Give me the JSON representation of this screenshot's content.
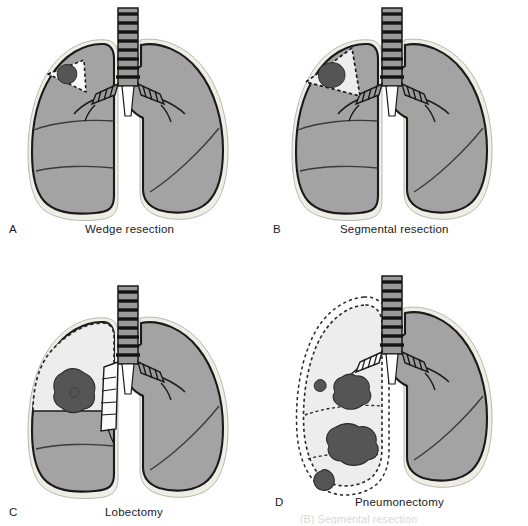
{
  "figure": {
    "background_color": "#ffffff",
    "panels": [
      {
        "letter": "A",
        "caption": "Wedge resection",
        "resection_region": "small triangular wedge in right upper lobe",
        "tumor_count": 1
      },
      {
        "letter": "B",
        "caption": "Segmental resection",
        "resection_region": "larger triangular segment in right upper lobe",
        "tumor_count": 1
      },
      {
        "letter": "C",
        "caption": "Lobectomy",
        "resection_region": "entire right upper lobe including lobar bronchus",
        "tumor_count": 1
      },
      {
        "letter": "D",
        "caption": "Pneumonectomy",
        "resection_region": "entire right lung including main bronchus",
        "tumor_count": 4
      }
    ],
    "cut_off_caption": "(B) Segmental resection",
    "colors": {
      "lung_fill": "#a3a3a3",
      "resected_fill": "#ededed",
      "wedge_fill": "#fafafa",
      "tumor_fill": "#555555",
      "pleura_halo": "#efeee6",
      "outline": "#1a1a1a",
      "dashed_outline": "#333333",
      "airway_fill": "#9a9a9a",
      "airway_ring": "#141414",
      "text": "#1a1a1a"
    },
    "anatomy_labels": {
      "trachea": "trachea",
      "main_bronchus": "main bronchus",
      "right_lung": "right lung",
      "left_lung": "left lung",
      "fissure": "interlobar fissure",
      "tumor": "tumor"
    }
  }
}
